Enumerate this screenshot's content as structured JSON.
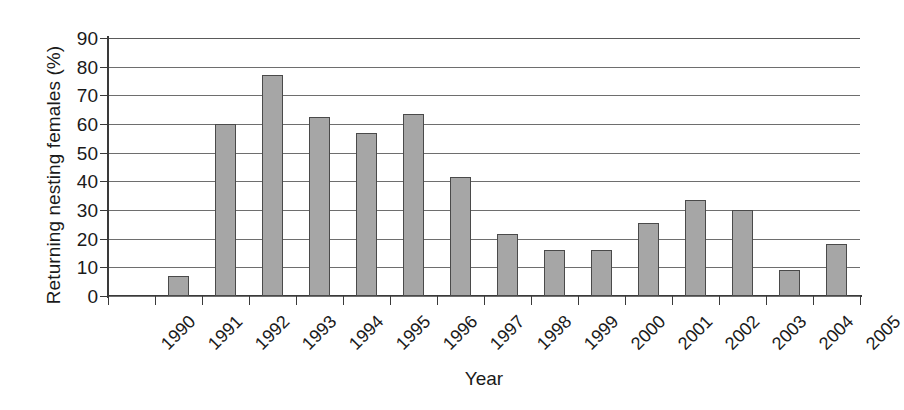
{
  "chart_data": {
    "type": "bar",
    "title": "",
    "xlabel": "Year",
    "ylabel": "Returning nesting females (%)",
    "categories": [
      "1990",
      "1991",
      "1992",
      "1993",
      "1994",
      "1995",
      "1996",
      "1997",
      "1998",
      "1999",
      "2000",
      "2001",
      "2002",
      "2003",
      "2004",
      "2005"
    ],
    "values": [
      0,
      7,
      60,
      77,
      62.5,
      57,
      63.5,
      41.5,
      21.5,
      16,
      16,
      25.5,
      33.5,
      30,
      9,
      18
    ],
    "ylim": [
      0,
      90
    ],
    "ytick_labels": [
      "0",
      "10",
      "20",
      "30",
      "40",
      "50",
      "60",
      "70",
      "80",
      "90"
    ],
    "ytick_values": [
      0,
      10,
      20,
      30,
      40,
      50,
      60,
      70,
      80,
      90
    ],
    "grid": "horizontal",
    "legend": "none",
    "bar_fill_color": "#a6a6a6",
    "bar_border_color": "#4a4a4a",
    "axis_color": "#3a3a3a",
    "gridline_color": "#6e6e6e",
    "text_color": "#1a1a1a",
    "xtick_label_rotation": -45
  }
}
